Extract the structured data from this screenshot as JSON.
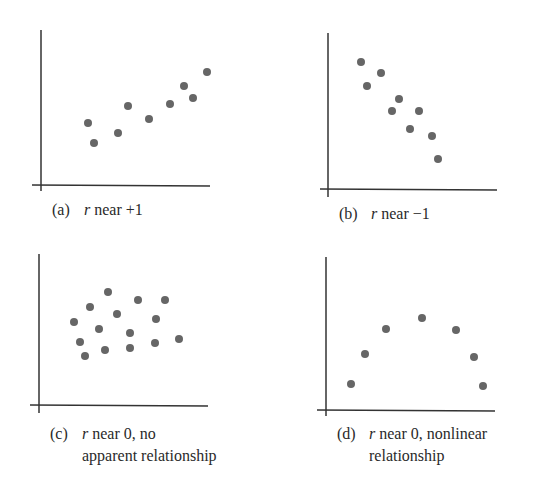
{
  "figure": {
    "dot_color": "#666666",
    "axis_color": "#333333",
    "background": "#ffffff"
  },
  "chart_data": [
    {
      "type": "scatter",
      "panel": "a",
      "caption": {
        "tag": "(a)",
        "var": "r",
        "text": " near +1",
        "line2": ""
      },
      "description": "Strong positive linear correlation",
      "axes": {
        "x0": 41,
        "y0": 185,
        "xTop": 30,
        "xRight": 210,
        "xLeftExt": 32,
        "yBottomExt": 191
      },
      "points": [
        [
          88,
          123
        ],
        [
          94,
          143
        ],
        [
          118,
          133
        ],
        [
          128,
          106
        ],
        [
          149,
          119
        ],
        [
          170,
          104
        ],
        [
          184,
          86
        ],
        [
          193,
          98
        ],
        [
          207,
          72
        ]
      ],
      "captionPos": {
        "x": 52,
        "y": 199
      },
      "grid": false,
      "ticks": false
    },
    {
      "type": "scatter",
      "panel": "b",
      "caption": {
        "tag": "(b)",
        "var": "r",
        "text": " near −1",
        "line2": ""
      },
      "description": "Strong negative linear correlation",
      "axes": {
        "x0": 328,
        "y0": 189,
        "xTop": 33,
        "xRight": 497,
        "xLeftExt": 320,
        "yBottomExt": 197
      },
      "points": [
        [
          361,
          62
        ],
        [
          367,
          86
        ],
        [
          381,
          73
        ],
        [
          399,
          99
        ],
        [
          392,
          111
        ],
        [
          419,
          111
        ],
        [
          410,
          129
        ],
        [
          432,
          136
        ],
        [
          438,
          159
        ]
      ],
      "captionPos": {
        "x": 339,
        "y": 203
      },
      "grid": false,
      "ticks": false
    },
    {
      "type": "scatter",
      "panel": "c",
      "caption": {
        "tag": "(c)",
        "var": "r",
        "text": " near 0, no",
        "line2": "apparent relationship"
      },
      "description": "No apparent relationship",
      "axes": {
        "x0": 39,
        "y0": 405,
        "xTop": 254,
        "xRight": 208,
        "xLeftExt": 30,
        "yBottomExt": 413
      },
      "points": [
        [
          108,
          292
        ],
        [
          90,
          307
        ],
        [
          138,
          300
        ],
        [
          165,
          300
        ],
        [
          74,
          322
        ],
        [
          117,
          314
        ],
        [
          99,
          329
        ],
        [
          156,
          319
        ],
        [
          130,
          333
        ],
        [
          80,
          342
        ],
        [
          105,
          350
        ],
        [
          130,
          348
        ],
        [
          155,
          343
        ],
        [
          179,
          339
        ],
        [
          85,
          356
        ]
      ],
      "captionPos": {
        "x": 50,
        "y": 423
      },
      "grid": false,
      "ticks": false
    },
    {
      "type": "scatter",
      "panel": "d",
      "caption": {
        "tag": "(d)",
        "var": "r",
        "text": " near 0, nonlinear",
        "line2": "relationship"
      },
      "description": "Nonlinear (inverted-U) relationship",
      "axes": {
        "x0": 326,
        "y0": 410,
        "xTop": 257,
        "xRight": 495,
        "xLeftExt": 317,
        "yBottomExt": 416
      },
      "points": [
        [
          351,
          384
        ],
        [
          365,
          354
        ],
        [
          386,
          329
        ],
        [
          422,
          318
        ],
        [
          456,
          330
        ],
        [
          474,
          357
        ],
        [
          483,
          386
        ]
      ],
      "captionPos": {
        "x": 337,
        "y": 423
      },
      "grid": false,
      "ticks": false
    }
  ]
}
